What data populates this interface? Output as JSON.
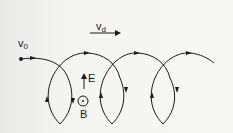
{
  "figure": {
    "labels": {
      "initial_velocity": {
        "symbol": "v",
        "subscript": "0"
      },
      "drift_velocity": {
        "symbol": "v",
        "subscript": "d"
      },
      "electric_field": "E",
      "magnetic_field": "B"
    },
    "colors": {
      "ink": "#1a1a1a",
      "background": "#f4f4f2"
    },
    "loops": 3
  }
}
